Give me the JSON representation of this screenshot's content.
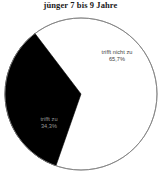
{
  "chart_data": {
    "type": "pie",
    "title": "jünger 7 bis 9 Jahre",
    "categories": [
      "trifft nicht zu",
      "trifft zu"
    ],
    "values": [
      65.7,
      34.3
    ],
    "value_labels": [
      "65,7%",
      "34,3%"
    ],
    "unit": "%",
    "colors": [
      "#ffffff",
      "#000000"
    ],
    "outline_color": "#808080",
    "legend": "none",
    "labels_inside": true,
    "start_angle_deg": 0,
    "direction": "clockwise",
    "slices": [
      {
        "name": "trifft nicht zu",
        "value": 65.7,
        "value_label": "65,7%",
        "fill": "#ffffff",
        "label_color": "#3d3d3d"
      },
      {
        "name": "trifft zu",
        "value": 34.3,
        "value_label": "34,3%",
        "fill": "#000000",
        "label_color": "#9a9a9a"
      }
    ]
  },
  "chart": {
    "title": "jünger 7 bis 9 Jahre",
    "slice_not_applicable": {
      "name": "trifft nicht zu",
      "value_label": "65,7%"
    },
    "slice_applicable": {
      "name": "trifft zu",
      "value_label": "34,3%"
    }
  }
}
